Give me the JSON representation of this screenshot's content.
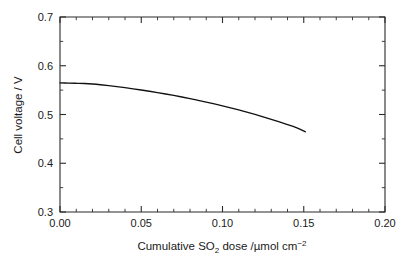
{
  "chart_data": {
    "type": "line",
    "title": "",
    "xlabel": "Cumulative SO2 dose /µmol cm-2",
    "ylabel": "Cell voltage / V",
    "xlim": [
      0.0,
      0.2
    ],
    "ylim": [
      0.3,
      0.7
    ],
    "grid": false,
    "legend": "none",
    "x_major_ticks": [
      0.0,
      0.05,
      0.1,
      0.15,
      0.2
    ],
    "x_major_tick_labels": [
      "0.00",
      "0.05",
      "0.10",
      "0.15",
      "0.20"
    ],
    "x_minor_tick_interval": 0.01,
    "y_major_ticks": [
      0.3,
      0.4,
      0.5,
      0.6,
      0.7
    ],
    "y_major_tick_labels": [
      "0.3",
      "0.4",
      "0.5",
      "0.6",
      "0.7"
    ],
    "y_minor_tick_interval": 0.05,
    "series": [
      {
        "name": "Cell voltage",
        "color": "#111111",
        "x": [
          0.0,
          0.005,
          0.01,
          0.015,
          0.02,
          0.025,
          0.03,
          0.035,
          0.04,
          0.045,
          0.05,
          0.055,
          0.06,
          0.065,
          0.07,
          0.075,
          0.08,
          0.085,
          0.09,
          0.095,
          0.1,
          0.105,
          0.11,
          0.115,
          0.12,
          0.125,
          0.13,
          0.135,
          0.14,
          0.145,
          0.151
        ],
        "y": [
          0.565,
          0.5645,
          0.564,
          0.5635,
          0.5625,
          0.561,
          0.5592,
          0.5572,
          0.555,
          0.5527,
          0.5503,
          0.5477,
          0.545,
          0.5421,
          0.5391,
          0.5359,
          0.5326,
          0.5291,
          0.5255,
          0.5217,
          0.5177,
          0.5136,
          0.5093,
          0.5048,
          0.5001,
          0.4952,
          0.4901,
          0.4848,
          0.4793,
          0.4736,
          0.4645
        ]
      }
    ]
  },
  "axis_titles": {
    "y": "Cell voltage / V",
    "x_part1": "Cumulative SO",
    "x_sub": "2",
    "x_part2": " dose /µmol cm",
    "x_sup": "−2"
  }
}
